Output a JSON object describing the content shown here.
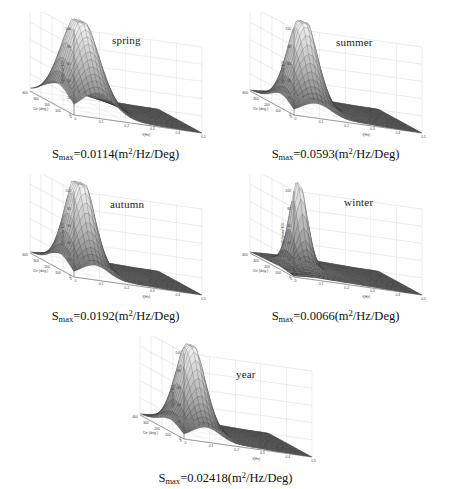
{
  "figure": {
    "axes": {
      "zlabel": "S(f)/Smax*100",
      "xlabel": "f(Hz)",
      "ylabel": "Dir (deg.)",
      "zticks": [
        "0",
        "20",
        "40",
        "60",
        "80",
        "100"
      ],
      "xticks": [
        "0",
        "0.1",
        "0.2",
        "0.3",
        "0.4",
        "0.5"
      ],
      "yticks": [
        "0",
        "100",
        "200",
        "300",
        "400"
      ],
      "zlim": [
        0,
        100
      ],
      "xlim": [
        0,
        0.5
      ],
      "ylim": [
        0,
        400
      ]
    },
    "caption_prefix": "S",
    "caption_sub": "max",
    "caption_eq": "=",
    "caption_unit_open": "(m",
    "caption_unit_sup": "2",
    "caption_unit_close": "/Hz/Deg)"
  },
  "colors": {
    "mesh_line": "#2b2b2b",
    "mesh_peak": "#f2f2f2",
    "mesh_base": "#4a4a4a",
    "axis": "#555555",
    "grid": "#bbbbbb",
    "text": "#111111",
    "background": "#ffffff"
  },
  "panels": [
    {
      "id": "spring",
      "season": "spring",
      "smax_value": "0.0114",
      "peak_height": 87,
      "peak_f": 0.105,
      "peak_dir": 205,
      "peak_width_f": 0.055,
      "peak_width_dir": 95,
      "secondary_height": 30,
      "secondary_f": 0.085,
      "secondary_dir": 95
    },
    {
      "id": "summer",
      "season": "summer",
      "smax_value": "0.0593",
      "peak_height": 92,
      "peak_f": 0.115,
      "peak_dir": 195,
      "peak_width_f": 0.045,
      "peak_width_dir": 70,
      "secondary_height": 32,
      "secondary_f": 0.08,
      "secondary_dir": 100
    },
    {
      "id": "autumn",
      "season": "autumn",
      "smax_value": "0.0192",
      "peak_height": 95,
      "peak_f": 0.105,
      "peak_dir": 200,
      "peak_width_f": 0.042,
      "peak_width_dir": 72,
      "secondary_height": 36,
      "secondary_f": 0.075,
      "secondary_dir": 110
    },
    {
      "id": "winter",
      "season": "winter",
      "smax_value": "0.0066",
      "peak_height": 96,
      "peak_f": 0.105,
      "peak_dir": 205,
      "peak_width_f": 0.028,
      "peak_width_dir": 45,
      "secondary_height": 14,
      "secondary_f": 0.08,
      "secondary_dir": 120
    },
    {
      "id": "year",
      "season": "year",
      "smax_value": "0.02418",
      "peak_height": 90,
      "peak_f": 0.108,
      "peak_dir": 200,
      "peak_width_f": 0.042,
      "peak_width_dir": 75,
      "secondary_height": 30,
      "secondary_f": 0.08,
      "secondary_dir": 105
    }
  ],
  "chart_data": {
    "type": "surface",
    "title": "",
    "xlabel": "f(Hz)",
    "ylabel": "Dir (deg.)",
    "zlabel": "S(f)/Smax*100",
    "xlim": [
      0,
      0.5
    ],
    "ylim": [
      0,
      400
    ],
    "zlim": [
      0,
      100
    ],
    "grid": true,
    "legend": "none",
    "subplots": [
      {
        "name": "spring",
        "annotation": "S_max=0.0114(m^2/Hz/Deg)",
        "smax": 0.0114,
        "peak": {
          "f": 0.105,
          "dir": 205,
          "z": 87
        },
        "secondary_peak": {
          "f": 0.085,
          "dir": 95,
          "z": 30
        }
      },
      {
        "name": "summer",
        "annotation": "S_max=0.0593(m^2/Hz/Deg)",
        "smax": 0.0593,
        "peak": {
          "f": 0.115,
          "dir": 195,
          "z": 92
        },
        "secondary_peak": {
          "f": 0.08,
          "dir": 100,
          "z": 32
        }
      },
      {
        "name": "autumn",
        "annotation": "S_max=0.0192(m^2/Hz/Deg)",
        "smax": 0.0192,
        "peak": {
          "f": 0.105,
          "dir": 200,
          "z": 95
        },
        "secondary_peak": {
          "f": 0.075,
          "dir": 110,
          "z": 36
        }
      },
      {
        "name": "winter",
        "annotation": "S_max=0.0066(m^2/Hz/Deg)",
        "smax": 0.0066,
        "peak": {
          "f": 0.105,
          "dir": 205,
          "z": 96
        },
        "secondary_peak": {
          "f": 0.08,
          "dir": 120,
          "z": 14
        }
      },
      {
        "name": "year",
        "annotation": "S_max=0.02418(m^2/Hz/Deg)",
        "smax": 0.02418,
        "peak": {
          "f": 0.108,
          "dir": 200,
          "z": 90
        },
        "secondary_peak": {
          "f": 0.08,
          "dir": 105,
          "z": 30
        }
      }
    ]
  }
}
